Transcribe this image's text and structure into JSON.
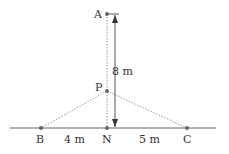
{
  "diagram": {
    "points": {
      "A": {
        "label": "A",
        "x": 107,
        "y": 14
      },
      "P": {
        "label": "P",
        "x": 107,
        "y": 91
      },
      "N": {
        "label": "N",
        "x": 107,
        "y": 128
      },
      "B": {
        "label": "B",
        "x": 41,
        "y": 128
      },
      "C": {
        "label": "C",
        "x": 187,
        "y": 128
      }
    },
    "dimensions": {
      "AN": "8 m",
      "BN": "4 m",
      "NC": "5 m"
    },
    "colors": {
      "line": "#555555",
      "dotted": "#888888",
      "point": "#555555",
      "text": "#333333"
    }
  }
}
